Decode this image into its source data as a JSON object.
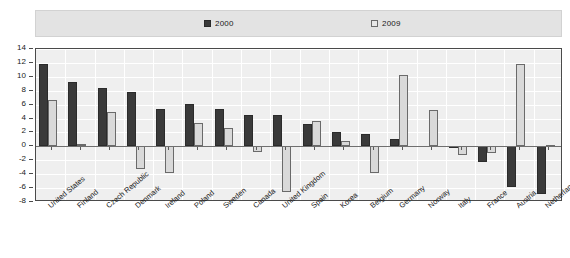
{
  "legend": {
    "position": "top",
    "entries": [
      {
        "label": "2000",
        "swatch": "dark-filled-square"
      },
      {
        "label": "2009",
        "swatch": "light-outlined-square"
      }
    ]
  },
  "axes": {
    "y_ticks": [
      "14",
      "12",
      "10",
      "8",
      "6",
      "4",
      "2",
      "0",
      "-2",
      "-4",
      "-6",
      "-8"
    ],
    "ylim": [
      -8,
      14
    ],
    "y_step": 2
  },
  "colors": {
    "series_2000": "#3a3a3a",
    "series_2009": "#d9d9d9",
    "plot_background": "#efefef",
    "legend_background": "#e3e3e3",
    "gridline": "#ffffff",
    "axis": "#4a4a4a"
  },
  "chart_data": {
    "type": "bar",
    "title": "",
    "subtitle": "",
    "xlabel": "",
    "ylabel": "",
    "ylim": [
      -8,
      14
    ],
    "grid": true,
    "legend_position": "top",
    "categories": [
      "United States",
      "Finland",
      "Czech Republic",
      "Denmark",
      "Ireland",
      "Poland",
      "Sweden",
      "Canada",
      "United Kingdom",
      "Spain",
      "Korea",
      "Belgium",
      "Germany",
      "Norway",
      "Italy",
      "France",
      "Austria",
      "Netherlands"
    ],
    "series": [
      {
        "name": "2000",
        "color": "#3a3a3a",
        "values": [
          11.9,
          9.3,
          8.4,
          7.8,
          5.4,
          6.1,
          5.4,
          4.5,
          4.5,
          3.2,
          2.1,
          1.8,
          1.0,
          0.0,
          -0.3,
          -2.3,
          -5.8,
          -6.8
        ]
      },
      {
        "name": "2009",
        "color": "#d9d9d9",
        "values": [
          6.6,
          0.4,
          4.9,
          -3.3,
          -3.8,
          3.3,
          2.6,
          -0.8,
          -6.5,
          3.6,
          0.8,
          -3.9,
          10.2,
          5.2,
          -1.3,
          -1.0,
          11.8,
          0.2
        ]
      }
    ]
  }
}
